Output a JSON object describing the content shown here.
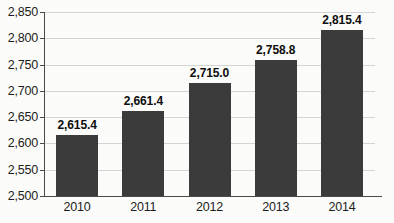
{
  "chart_data": {
    "type": "bar",
    "title": "",
    "subtitle": "",
    "xlabel": "",
    "ylabel": "",
    "categories": [
      "2010",
      "2011",
      "2012",
      "2013",
      "2014"
    ],
    "values": [
      2615.4,
      2661.4,
      2715.0,
      2758.8,
      2815.4
    ],
    "value_labels": [
      "2,615.4",
      "2,661.4",
      "2,715.0",
      "2,758.8",
      "2,815.4"
    ],
    "ylim": [
      2500,
      2850
    ],
    "ytick_step": 50,
    "ytick_labels": [
      "2,850",
      "2,800",
      "2,750",
      "2,700",
      "2,650",
      "2,600",
      "2,550",
      "2,500"
    ],
    "ytick_values": [
      2850,
      2800,
      2750,
      2700,
      2650,
      2600,
      2550,
      2500
    ],
    "grid": true,
    "grid_axis": "y",
    "legend": false,
    "legend_position": "none",
    "bar_color": "#3b3b3b",
    "gridline_color": "#d4d4d4",
    "axis_color": "#4a4a4a",
    "background_color": "#fbfbf9",
    "data_labels_shown": true
  }
}
